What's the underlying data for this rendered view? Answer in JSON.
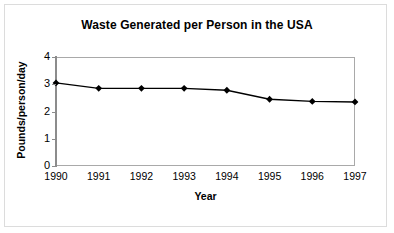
{
  "figure": {
    "background_color": "#ffffff",
    "frame_color": "#dcdcdc",
    "axis_color": "#a9a9a9",
    "series_color": "#000000"
  },
  "chart_data": {
    "type": "line",
    "title": "Waste Generated per Person in the USA",
    "xlabel": "Year",
    "ylabel": "Pounds/person/day",
    "categories": [
      "1990",
      "1991",
      "1992",
      "1993",
      "1994",
      "1995",
      "1996",
      "1997"
    ],
    "x": [
      1990,
      1991,
      1992,
      1993,
      1994,
      1995,
      1996,
      1997
    ],
    "values": [
      3.05,
      2.85,
      2.85,
      2.85,
      2.78,
      2.45,
      2.37,
      2.35
    ],
    "series": [
      {
        "name": "Waste generated per person",
        "values": [
          3.05,
          2.85,
          2.85,
          2.85,
          2.78,
          2.45,
          2.37,
          2.35
        ],
        "marker": "diamond",
        "color": "#000000"
      }
    ],
    "ylim": [
      0,
      4
    ],
    "yticks": [
      0,
      1,
      2,
      3,
      4
    ],
    "ytick_labels": [
      "0",
      "1",
      "2",
      "3",
      "4"
    ],
    "xtick_labels": [
      "1990",
      "1991",
      "1992",
      "1993",
      "1994",
      "1995",
      "1996",
      "1997"
    ],
    "grid": false,
    "legend": false,
    "legend_position": "none"
  }
}
